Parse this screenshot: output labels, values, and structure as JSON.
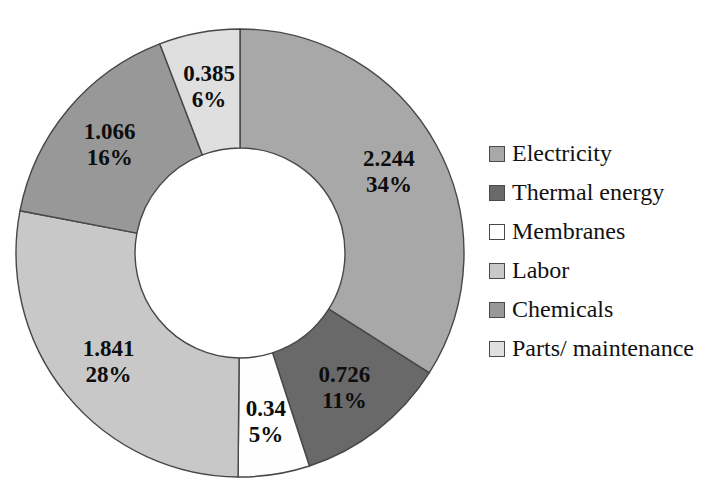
{
  "page": {
    "background": "#ffffff",
    "width": 721,
    "height": 486
  },
  "chart_data": {
    "type": "pie",
    "subtype": "donut",
    "legend_position": "right",
    "direction": "clockwise",
    "start_angle_deg": 0,
    "donut_hole_ratio": 0.47,
    "slice_border_color": "#474747",
    "label_text_color": "#0d0d0d",
    "series": [
      {
        "label": "Electricity",
        "value": 2.244,
        "value_label": "2.244",
        "pct_label": "34%",
        "color": "#a8a8a8"
      },
      {
        "label": "Thermal energy",
        "value": 0.726,
        "value_label": "0.726",
        "pct_label": "11%",
        "color": "#696969"
      },
      {
        "label": "Membranes",
        "value": 0.34,
        "value_label": "0.34",
        "pct_label": "5%",
        "color": "#fefefe"
      },
      {
        "label": "Labor",
        "value": 1.841,
        "value_label": "1.841",
        "pct_label": "28%",
        "color": "#c8c8c8"
      },
      {
        "label": "Chemicals",
        "value": 1.066,
        "value_label": "1.066",
        "pct_label": "16%",
        "color": "#989898"
      },
      {
        "label": "Parts/ maintenance",
        "value": 0.385,
        "value_label": "0.385",
        "pct_label": "6%",
        "color": "#dfdfdf"
      }
    ]
  }
}
